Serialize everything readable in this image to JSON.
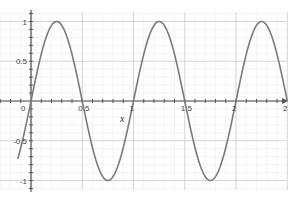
{
  "chart_data": {
    "type": "line",
    "title": "",
    "xlabel": "x",
    "ylabel": "",
    "function": "sin(2*pi*x)",
    "xlim": [
      -0.13,
      2.5
    ],
    "ylim": [
      -1,
      1
    ],
    "x_ticks": [
      "0",
      "0.5",
      "1",
      "1.5",
      "2"
    ],
    "x_tick_values": [
      0,
      0.5,
      1,
      1.5,
      2
    ],
    "x_axis_end_label": "2",
    "y_ticks": [
      "1",
      "0.5",
      "-0.5",
      "-1"
    ],
    "y_tick_values": [
      1,
      0.5,
      -0.5,
      -1
    ],
    "grid": true,
    "legend": null,
    "series": [
      {
        "name": "y = sin(2πx)",
        "color": "#7a7a7a",
        "x": [
          -0.13,
          0,
          0.25,
          0.5,
          0.75,
          1,
          1.25,
          1.5,
          1.75,
          2,
          2.25,
          2.5
        ],
        "values": [
          -0.73,
          0,
          1,
          0,
          -1,
          0,
          1,
          0,
          -1,
          0,
          1,
          0
        ]
      }
    ]
  },
  "colors": {
    "curve": "#7a7a7a",
    "axis": "#555555",
    "grid_major": "#d4d4d4",
    "grid_minor": "#eeeeee",
    "background": "#ffffff"
  }
}
